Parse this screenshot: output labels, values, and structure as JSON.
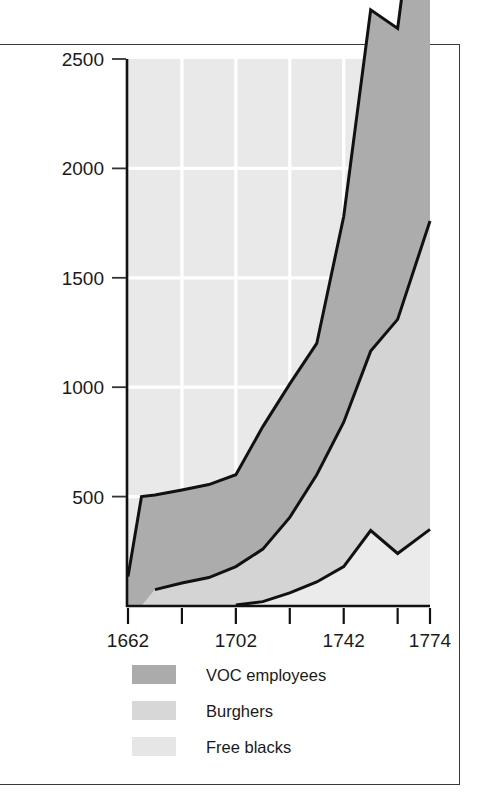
{
  "figure": {
    "background_color": "#ffffff",
    "frame_color": "#3a3a3a",
    "plot_background_color": "#e9e9e9",
    "gridline_color": "#ffffff",
    "axis_color": "#111111"
  },
  "chart_data": {
    "type": "area",
    "stacked": true,
    "title": "",
    "subtitle": "",
    "xlabel": "",
    "ylabel": "",
    "xlim": [
      1662,
      1774
    ],
    "ylim": [
      0,
      2500
    ],
    "grid": true,
    "legend_position": "below-axis-left",
    "x_tick_labels": [
      "1662",
      "1702",
      "1742",
      "1774"
    ],
    "x_tick_values": [
      1662,
      1682,
      1702,
      1722,
      1742,
      1762,
      1774
    ],
    "x_tick_labeled": [
      1662,
      1702,
      1742,
      1774
    ],
    "y_tick_labels": [
      "500",
      "1000",
      "1500",
      "2000",
      "2500"
    ],
    "y_tick_values": [
      500,
      1000,
      1500,
      2000,
      2500
    ],
    "x": [
      1662,
      1667,
      1672,
      1682,
      1692,
      1702,
      1712,
      1722,
      1732,
      1742,
      1752,
      1762,
      1774
    ],
    "series": [
      {
        "name": "Free blacks",
        "key": "free_blacks",
        "color": "#ebebeb",
        "swatch_color": "#e6e6e6",
        "values": [
          0,
          0,
          0,
          0,
          0,
          5,
          20,
          60,
          110,
          180,
          345,
          240,
          350
        ]
      },
      {
        "name": "Burghers",
        "key": "burghers",
        "color": "#d4d4d4",
        "swatch_color": "#d7d7d7",
        "values": [
          0,
          0,
          75,
          105,
          130,
          175,
          240,
          345,
          490,
          660,
          820,
          1070,
          1410
        ]
      },
      {
        "name": "VOC employees",
        "key": "voc_employees",
        "color": "#acacac",
        "swatch_color": "#ababab",
        "values": [
          135,
          500,
          432,
          425,
          425,
          420,
          560,
          610,
          600,
          940,
          1560,
          1330,
          2010
        ]
      }
    ],
    "cumulative_top_line": [
      135,
      500,
      432,
      425,
      425,
      420,
      560,
      610,
      600,
      940,
      1560,
      1330,
      2010
    ]
  },
  "legend": {
    "items": [
      {
        "label": "VOC employees",
        "swatch": "#ababab"
      },
      {
        "label": "Burghers",
        "swatch": "#d7d7d7"
      },
      {
        "label": "Free blacks",
        "swatch": "#e6e6e6"
      }
    ]
  }
}
